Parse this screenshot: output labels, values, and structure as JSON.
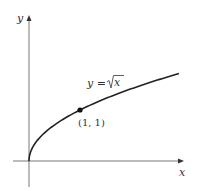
{
  "chart_data": {
    "type": "line",
    "title": "",
    "xlabel": "x",
    "ylabel": "y",
    "series": [
      {
        "name": "y = √x",
        "function": "sqrt(x)",
        "x_range": [
          0,
          2.94
        ]
      }
    ],
    "annotations": [
      {
        "label": "(1, 1)",
        "x": 1,
        "y": 1,
        "marker": "dot"
      },
      {
        "label": "y = √x",
        "position": "above curve"
      }
    ],
    "xlim": [
      -0.5,
      3.05
    ],
    "ylim": [
      -0.5,
      2.7
    ],
    "grid": false,
    "legend": "none"
  },
  "labels": {
    "x_axis": "x",
    "y_axis": "y",
    "eq_lhs": "y = ",
    "eq_rad": "x",
    "point": "(1, 1)"
  }
}
